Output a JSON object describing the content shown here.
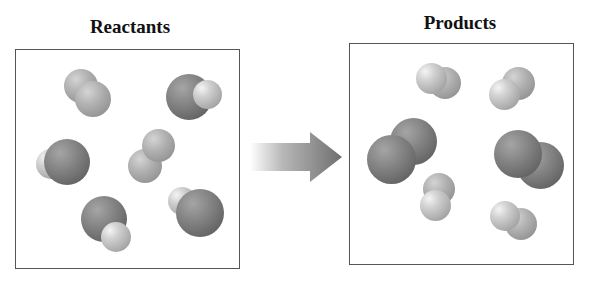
{
  "diagram": {
    "left_panel": {
      "title": "Reactants",
      "molecules": [
        {
          "type": "diatomic-light-light",
          "label": "light-gray diatomic"
        },
        {
          "type": "diatomic-dark-light",
          "label": "dark+light diatomic"
        },
        {
          "type": "diatomic-dark-light",
          "label": "dark+light diatomic"
        },
        {
          "type": "diatomic-light-light",
          "label": "light-gray diatomic"
        },
        {
          "type": "diatomic-dark-light",
          "label": "dark+light diatomic"
        },
        {
          "type": "diatomic-dark-light",
          "label": "dark+light diatomic"
        }
      ]
    },
    "arrow": {
      "direction": "right",
      "style": "gradient",
      "color": "#6e6e6e"
    },
    "right_panel": {
      "title": "Products",
      "molecules": [
        {
          "type": "diatomic-light-light",
          "label": "light diatomic"
        },
        {
          "type": "diatomic-light-light",
          "label": "light diatomic"
        },
        {
          "type": "diatomic-dark-dark",
          "label": "dark diatomic"
        },
        {
          "type": "diatomic-dark-dark",
          "label": "dark diatomic"
        },
        {
          "type": "diatomic-light-light",
          "label": "light diatomic"
        },
        {
          "type": "diatomic-light-light",
          "label": "light diatomic"
        }
      ]
    }
  }
}
